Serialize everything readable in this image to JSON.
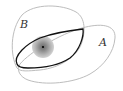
{
  "diagram": {
    "labels": {
      "a": "A",
      "b": "B"
    },
    "colors": {
      "outer_curves": "#bbbbbb",
      "inner_curve": "#111111",
      "disc_outer": "#c8c8c8",
      "disc_inner": "#8a8a8a",
      "point": "#000000"
    }
  }
}
